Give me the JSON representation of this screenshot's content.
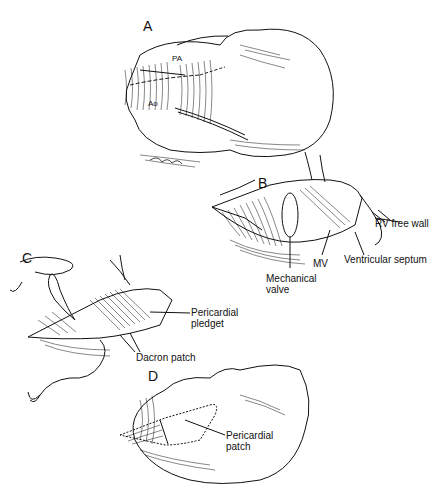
{
  "figure": {
    "panels": [
      {
        "id": "A",
        "labels": [
          "PA",
          "Ao"
        ]
      },
      {
        "id": "B",
        "labels": [
          "RV free wall",
          "Ventricular septum",
          "MV",
          "Mechanical valve"
        ]
      },
      {
        "id": "C",
        "labels": [
          "Pericardial pledget",
          "Dacron patch"
        ]
      },
      {
        "id": "D",
        "labels": [
          "Pericardial patch"
        ]
      }
    ]
  },
  "text": {
    "panel_a": "A",
    "panel_b": "B",
    "panel_c": "C",
    "panel_d": "D",
    "pa": "PA",
    "ao": "Ao",
    "rv_free_wall": "RV free wall",
    "ventricular_septum": "Ventricular septum",
    "mv": "MV",
    "mechanical_valve_1": "Mechanical",
    "mechanical_valve_2": "valve",
    "pericardial_pledget_1": "Pericardial",
    "pericardial_pledget_2": "pledget",
    "dacron_patch": "Dacron patch",
    "pericardial_patch_1": "Pericardial",
    "pericardial_patch_2": "patch"
  }
}
